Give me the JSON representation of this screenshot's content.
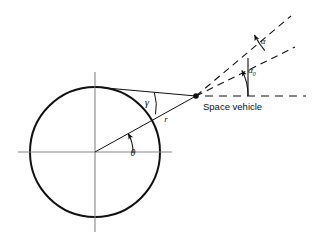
{
  "figure": {
    "background_color": "#ffffff",
    "line_color": "#111111",
    "axis_color": "#777777",
    "width": 317,
    "height": 241
  },
  "labels": {
    "gamma": "γ",
    "radius": "r",
    "theta": "θ",
    "alpha": "α",
    "alpha_zero_base": "α",
    "alpha_zero_sub": "0",
    "space_vehicle": "Space vehicle"
  },
  "geometry": {
    "circle": {
      "center_x": 95,
      "center_y": 152,
      "radius": 65,
      "stroke_width": 2.0
    },
    "vertical_axis": {
      "x": 95,
      "y1": 72,
      "y2": 232
    },
    "horizontal_axis": {
      "y": 152,
      "x1": 18,
      "x2": 172
    },
    "vehicle_point": {
      "x": 196,
      "y": 96,
      "dot_radius": 2.6
    },
    "circle_top_point": {
      "x": 95,
      "y": 87
    },
    "radius_vector": {
      "from_x": 95,
      "from_y": 152,
      "to_x": 196,
      "to_y": 96,
      "angle_deg": 29
    },
    "chord_to_top": {
      "from_x": 95,
      "from_y": 87,
      "to_x": 196,
      "to_y": 96
    },
    "theta_arc": {
      "center_x": 95,
      "center_y": 152,
      "radius": 40,
      "start_deg": 0,
      "end_deg": 29
    },
    "gamma_arc": {
      "vertex_x": 196,
      "vertex_y": 96,
      "radius": 42
    },
    "dashed_ray_upper": {
      "from_x": 196,
      "from_y": 96,
      "to_x": 291,
      "to_y": 16
    },
    "dashed_ray_lower": {
      "from_x": 196,
      "from_y": 96,
      "to_x": 295,
      "to_y": 47
    },
    "dashed_horizontal": {
      "from_x": 205,
      "from_y": 96,
      "to_x": 306,
      "to_y": 96
    },
    "alpha_arc": {
      "vertex_x": 196,
      "vertex_y": 96,
      "radius": 77
    },
    "alpha_zero_arc": {
      "vertex_x": 196,
      "vertex_y": 96,
      "radius": 52
    },
    "vertical_tick": {
      "x": 248,
      "y1": 56,
      "y2": 96
    }
  },
  "label_positions": {
    "gamma": {
      "x": 147,
      "y": 106
    },
    "radius": {
      "x": 166,
      "y": 122
    },
    "theta": {
      "x": 131,
      "y": 155
    },
    "alpha": {
      "x": 263,
      "y": 42
    },
    "alpha_zero": {
      "x": 252,
      "y": 72
    },
    "space_vehicle": {
      "x": 203,
      "y": 110
    }
  }
}
